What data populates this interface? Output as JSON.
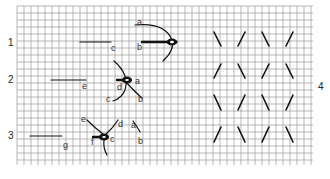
{
  "diagram": {
    "grid": {
      "x": 17,
      "y": 6,
      "width": 296,
      "height": 159,
      "cell": 7,
      "color": "#9a9a9a"
    },
    "steps": [
      {
        "number": "1",
        "x": 8,
        "y": 38
      },
      {
        "number": "2",
        "x": 8,
        "y": 75
      },
      {
        "number": "3",
        "x": 8,
        "y": 131
      },
      {
        "number": "4",
        "x": 318,
        "y": 82
      }
    ],
    "labels": [
      {
        "text": "a",
        "x": 137,
        "y": 18
      },
      {
        "text": "b",
        "x": 137,
        "y": 43
      },
      {
        "text": "c",
        "x": 111,
        "y": 44
      },
      {
        "text": "a",
        "x": 135,
        "y": 77
      },
      {
        "text": "d",
        "x": 117,
        "y": 83
      },
      {
        "text": "e",
        "x": 82,
        "y": 82
      },
      {
        "text": "c",
        "x": 106,
        "y": 95
      },
      {
        "text": "b",
        "x": 138,
        "y": 95
      },
      {
        "text": "e",
        "x": 81,
        "y": 115
      },
      {
        "text": "d",
        "x": 118,
        "y": 120
      },
      {
        "text": "a",
        "x": 131,
        "y": 121
      },
      {
        "text": "c",
        "x": 110,
        "y": 135
      },
      {
        "text": "f",
        "x": 91,
        "y": 138
      },
      {
        "text": "b",
        "x": 138,
        "y": 137
      },
      {
        "text": "g",
        "x": 63,
        "y": 141
      }
    ]
  }
}
